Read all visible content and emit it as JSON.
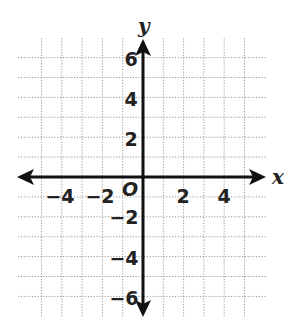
{
  "diagram": {
    "type": "coordinate-plane",
    "axes": {
      "x_label": "x",
      "y_label": "y",
      "origin_label": "O",
      "x_range": [
        -6,
        6
      ],
      "y_range": [
        -7,
        7
      ],
      "arrows": "both-ends"
    },
    "grid": {
      "x_lines": [
        -5,
        -4,
        -3,
        -2,
        -1,
        1,
        2,
        3,
        4,
        5
      ],
      "y_lines": [
        -6,
        -5,
        -4,
        -3,
        -2,
        -1,
        1,
        2,
        3,
        4,
        5,
        6
      ],
      "style": "dotted",
      "unit": 1
    },
    "x_ticks": [
      {
        "value": -4,
        "label": "−4"
      },
      {
        "value": -2,
        "label": "−2"
      },
      {
        "value": 2,
        "label": "2"
      },
      {
        "value": 4,
        "label": "4"
      }
    ],
    "y_ticks": [
      {
        "value": 6,
        "label": "6"
      },
      {
        "value": 4,
        "label": "4"
      },
      {
        "value": 2,
        "label": "2"
      },
      {
        "value": -2,
        "label": "−2"
      },
      {
        "value": -4,
        "label": "−4"
      },
      {
        "value": -6,
        "label": "−6"
      }
    ],
    "colors": {
      "axis": "#111111",
      "grid": "#9a9a9a",
      "text": "#222222",
      "background": "#ffffff"
    }
  }
}
